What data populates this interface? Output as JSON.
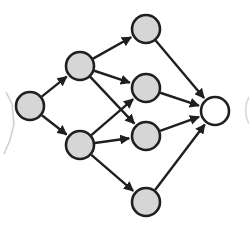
{
  "diagram": {
    "type": "directed-graph",
    "colors": {
      "background": "#ffffff",
      "stroke": "#1f1f1f",
      "node_fill": "#d6d6d6",
      "output_fill": "#ffffff",
      "ghost": "#cfcfcf"
    },
    "node_radius": 14,
    "nodes": [
      {
        "id": "A",
        "layer": 0,
        "x": 30,
        "y": 106,
        "fill": "gray"
      },
      {
        "id": "B",
        "layer": 1,
        "x": 80,
        "y": 66,
        "fill": "gray"
      },
      {
        "id": "C",
        "layer": 1,
        "x": 80,
        "y": 145,
        "fill": "gray"
      },
      {
        "id": "D",
        "layer": 2,
        "x": 146,
        "y": 29,
        "fill": "gray"
      },
      {
        "id": "E",
        "layer": 2,
        "x": 146,
        "y": 88,
        "fill": "gray"
      },
      {
        "id": "F",
        "layer": 2,
        "x": 146,
        "y": 136,
        "fill": "gray"
      },
      {
        "id": "G",
        "layer": 2,
        "x": 146,
        "y": 202,
        "fill": "gray"
      },
      {
        "id": "H",
        "layer": 3,
        "x": 215,
        "y": 111,
        "fill": "white"
      }
    ],
    "edges": [
      {
        "from": "A",
        "to": "B"
      },
      {
        "from": "A",
        "to": "C"
      },
      {
        "from": "B",
        "to": "D"
      },
      {
        "from": "B",
        "to": "E"
      },
      {
        "from": "B",
        "to": "F"
      },
      {
        "from": "C",
        "to": "E"
      },
      {
        "from": "C",
        "to": "F"
      },
      {
        "from": "C",
        "to": "G"
      },
      {
        "from": "D",
        "to": "H"
      },
      {
        "from": "E",
        "to": "H"
      },
      {
        "from": "F",
        "to": "H"
      },
      {
        "from": "G",
        "to": "H"
      }
    ]
  }
}
